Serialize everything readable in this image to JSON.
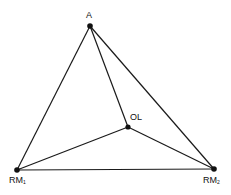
{
  "diagram": {
    "type": "graph",
    "nodes": [
      {
        "id": "A",
        "label": "A",
        "subscript": "",
        "x": 90,
        "y": 26
      },
      {
        "id": "OL",
        "label": "OL",
        "subscript": "",
        "x": 128,
        "y": 127
      },
      {
        "id": "RM1",
        "label": "RM",
        "subscript": "1",
        "x": 17,
        "y": 170
      },
      {
        "id": "RM2",
        "label": "RM",
        "subscript": "2",
        "x": 214,
        "y": 169
      }
    ],
    "edges": [
      {
        "from": "A",
        "to": "RM1"
      },
      {
        "from": "A",
        "to": "RM2"
      },
      {
        "from": "A",
        "to": "OL"
      },
      {
        "from": "OL",
        "to": "RM1"
      },
      {
        "from": "OL",
        "to": "RM2"
      },
      {
        "from": "RM1",
        "to": "RM2"
      }
    ],
    "colors": {
      "line": "#1a1a1a",
      "node": "#111111",
      "background": "#ffffff"
    }
  }
}
